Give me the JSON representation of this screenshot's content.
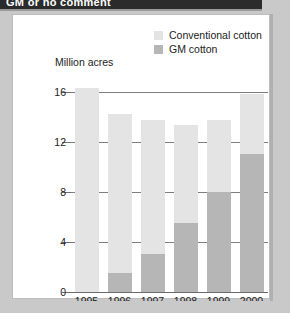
{
  "header": {
    "title": "GM or no comment"
  },
  "chart_data": {
    "type": "bar",
    "stacked": true,
    "title": "GM or no comment",
    "ylabel": "Million acres",
    "xlabel": "",
    "categories": [
      "1995",
      "1996",
      "1997",
      "1998",
      "1999",
      "2000"
    ],
    "series": [
      {
        "name": "GM cotton",
        "color": "#b6b6b6",
        "values": [
          0,
          1.5,
          3.0,
          5.5,
          8.0,
          11.0
        ]
      },
      {
        "name": "Conventional cotton",
        "color": "#e4e4e4",
        "values": [
          16.3,
          12.7,
          10.7,
          7.8,
          5.7,
          4.8
        ]
      }
    ],
    "totals": [
      16.3,
      14.2,
      13.7,
      13.3,
      13.7,
      15.8
    ],
    "ylim": [
      0,
      17
    ],
    "yticks": [
      0,
      4,
      8,
      12,
      16
    ],
    "ytick_labels": [
      "0",
      "4",
      "8",
      "12",
      "16"
    ],
    "grid": true,
    "legend_position": "top-right"
  },
  "legend": {
    "items": [
      {
        "label": "Conventional cotton",
        "swatch": "light-gray"
      },
      {
        "label": "GM cotton",
        "swatch": "dark-gray"
      }
    ]
  },
  "axis": {
    "y_title": "Million acres",
    "y_ticks": [
      "16",
      "12",
      "8",
      "4",
      "0"
    ],
    "x_ticks": [
      "1995",
      "1996",
      "1997",
      "1998",
      "1999",
      "2000"
    ]
  }
}
